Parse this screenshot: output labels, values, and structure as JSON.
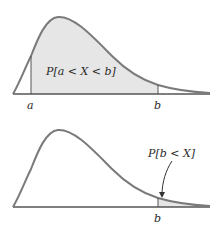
{
  "colors": {
    "curve": "#7a7a7a",
    "shade": "#e6e6e6",
    "axis": "#555555",
    "text": "#2a2a2a"
  },
  "top_panel": {
    "label": "P[a < X < b]",
    "tick_a": "a",
    "tick_b": "b",
    "shaded_region": "between a and b"
  },
  "bottom_panel": {
    "label": "P[b < X]",
    "tick_b": "b",
    "shaded_region": "right of b"
  }
}
